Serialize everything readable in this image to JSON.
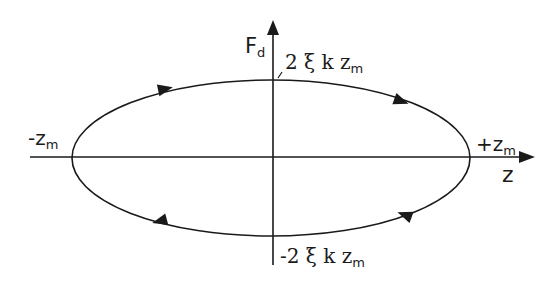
{
  "diagram": {
    "type": "phase-ellipse",
    "axes": {
      "y_label_main": "F",
      "y_label_sub": "d",
      "x_label": "z"
    },
    "labels": {
      "top_main": "2 ξ k z",
      "top_sub": "m",
      "bottom_main": "-2 ξ k z",
      "bottom_sub": "m",
      "left_main": "-z",
      "left_sub": "m",
      "right_main": "+z",
      "right_sub": "m"
    },
    "ellipse": {
      "center_x": 271,
      "center_y": 158,
      "radius_x": 199,
      "radius_y": 78,
      "direction": "clockwise"
    },
    "colors": {
      "stroke": "#1a1a1a",
      "background": "#ffffff"
    }
  }
}
